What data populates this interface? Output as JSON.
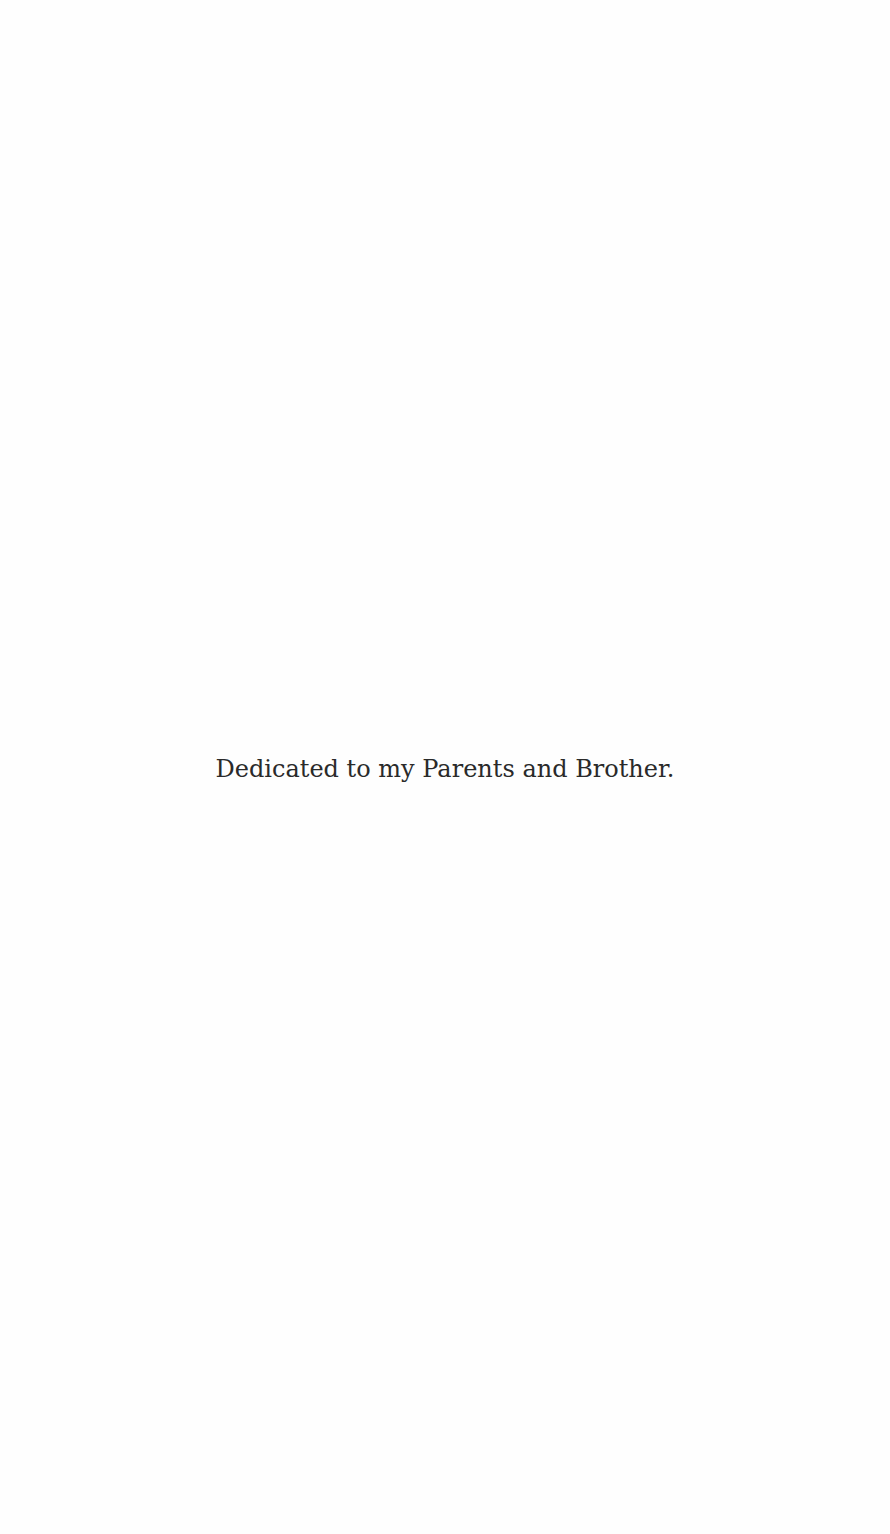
{
  "page": {
    "type": "dedication",
    "dedication_text": "Dedicated to my Parents and Brother."
  }
}
